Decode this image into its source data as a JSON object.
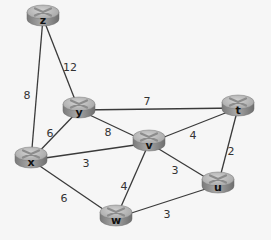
{
  "graph": {
    "nodes": [
      {
        "id": "z",
        "label": "z",
        "x": 43,
        "y": 18
      },
      {
        "id": "y",
        "label": "y",
        "x": 79,
        "y": 110
      },
      {
        "id": "t",
        "label": "t",
        "x": 238,
        "y": 108
      },
      {
        "id": "v",
        "label": "v",
        "x": 149,
        "y": 143
      },
      {
        "id": "x",
        "label": "x",
        "x": 31,
        "y": 160
      },
      {
        "id": "u",
        "label": "u",
        "x": 218,
        "y": 185
      },
      {
        "id": "w",
        "label": "w",
        "x": 116,
        "y": 218
      }
    ],
    "edges": [
      {
        "from": "z",
        "to": "x",
        "weight": "8",
        "lx": 27,
        "ly": 96
      },
      {
        "from": "z",
        "to": "y",
        "weight": "12",
        "lx": 70,
        "ly": 68
      },
      {
        "from": "y",
        "to": "t",
        "weight": "7",
        "lx": 147,
        "ly": 102
      },
      {
        "from": "y",
        "to": "x",
        "weight": "6",
        "lx": 50,
        "ly": 134
      },
      {
        "from": "y",
        "to": "v",
        "weight": "8",
        "lx": 108,
        "ly": 133
      },
      {
        "from": "x",
        "to": "v",
        "weight": "3",
        "lx": 86,
        "ly": 164
      },
      {
        "from": "v",
        "to": "t",
        "weight": "4",
        "lx": 193,
        "ly": 136
      },
      {
        "from": "v",
        "to": "u",
        "weight": "3",
        "lx": 175,
        "ly": 171
      },
      {
        "from": "v",
        "to": "w",
        "weight": "4",
        "lx": 124,
        "ly": 187
      },
      {
        "from": "t",
        "to": "u",
        "weight": "2",
        "lx": 231,
        "ly": 152
      },
      {
        "from": "x",
        "to": "w",
        "weight": "6",
        "lx": 64,
        "ly": 199
      },
      {
        "from": "w",
        "to": "u",
        "weight": "3",
        "lx": 167,
        "ly": 215
      }
    ]
  },
  "colors": {
    "background": "#f6f6f6",
    "edge": "#3a3a3a",
    "router_top": "#b9b9b9",
    "router_side": "#8a8a8a",
    "router_mark": "#e8e8e8"
  }
}
